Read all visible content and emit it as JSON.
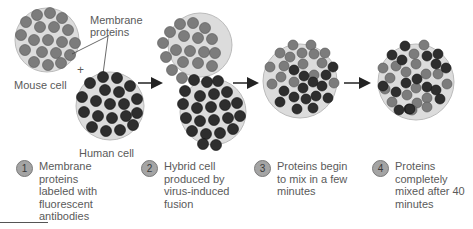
{
  "labels": {
    "membrane_proteins": "Membrane proteins",
    "mouse_cell": "Mouse cell",
    "human_cell": "Human cell",
    "plus": "+"
  },
  "steps": [
    {
      "number": "1",
      "text": "Membrane proteins labeled with fluorescent antibodies"
    },
    {
      "number": "2",
      "text": "Hybrid cell produced by virus-induced fusion"
    },
    {
      "number": "3",
      "text": "Proteins begin to mix in a few minutes"
    },
    {
      "number": "4",
      "text": "Proteins completely mixed after 40 minutes"
    }
  ],
  "colors": {
    "mouse_protein": "#7c7c7c",
    "human_protein": "#2e2e2e",
    "membrane": "#dcdcdc",
    "badge": "#a4a4a4"
  }
}
